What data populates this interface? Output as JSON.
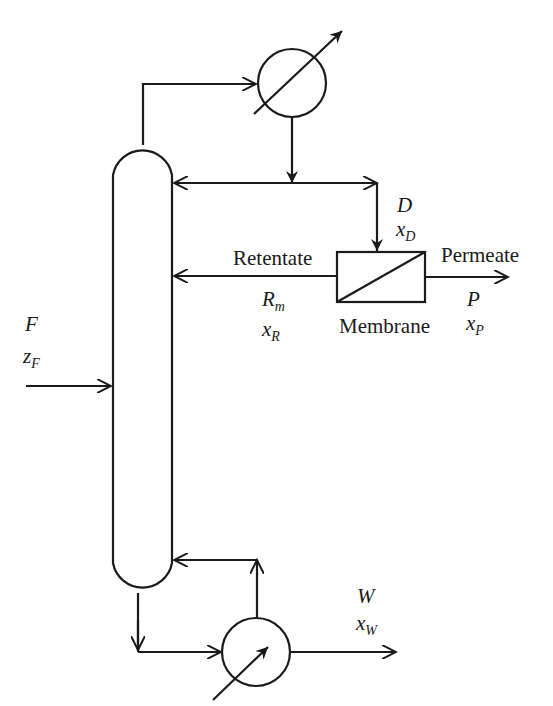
{
  "diagram": {
    "type": "process-flow",
    "units": {
      "column": {
        "name": "Distillation column"
      },
      "condenser": {
        "name": "Condenser"
      },
      "reboiler": {
        "name": "Reboiler"
      },
      "membrane": {
        "name": "Membrane",
        "label": "Membrane"
      }
    },
    "streams": {
      "feed": {
        "symbol": "F",
        "comp_var": "z",
        "comp_sub": "F"
      },
      "distillate": {
        "symbol": "D",
        "comp_var": "x",
        "comp_sub": "D"
      },
      "retentate": {
        "label": "Retentate",
        "symbol": "R",
        "symbol_sub": "m",
        "comp_var": "x",
        "comp_sub": "R"
      },
      "permeate": {
        "label": "Permeate",
        "symbol": "P",
        "comp_var": "x",
        "comp_sub": "P"
      },
      "bottoms": {
        "symbol": "W",
        "comp_var": "x",
        "comp_sub": "W"
      }
    },
    "colors": {
      "line": "#1a1a1a",
      "background": "#ffffff"
    }
  }
}
